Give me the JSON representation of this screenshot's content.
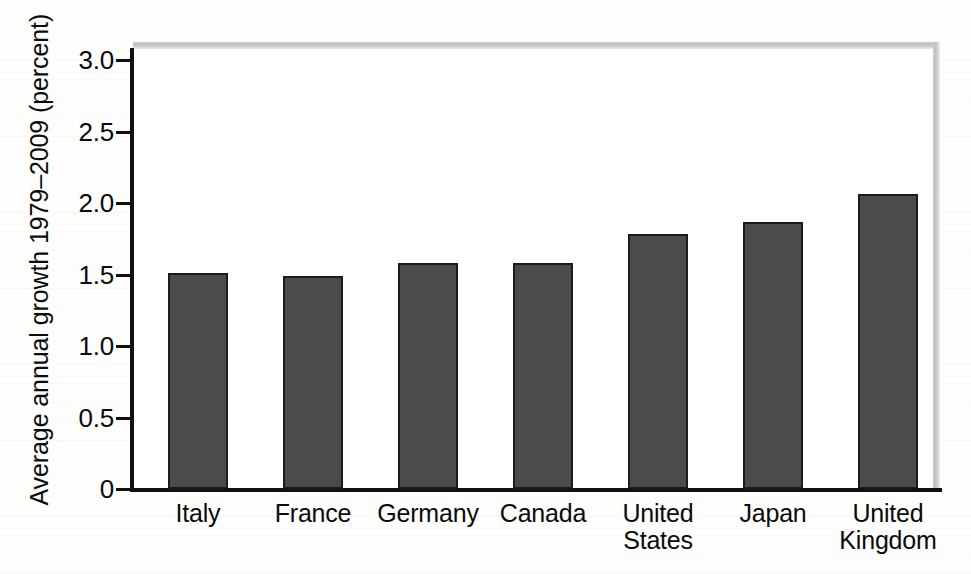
{
  "chart_data": {
    "type": "bar",
    "title": "",
    "subtitle": "",
    "xlabel": "",
    "ylabel": "Average annual growth 1979–2009 (percent)",
    "categories": [
      "Italy",
      "France",
      "Germany",
      "Canada",
      "United States",
      "Japan",
      "United Kingdom"
    ],
    "values": [
      1.51,
      1.49,
      1.58,
      1.58,
      1.78,
      1.87,
      2.06
    ],
    "ylim": [
      0,
      3.0
    ],
    "yticks": [
      0,
      0.5,
      1.0,
      1.5,
      2.0,
      2.5,
      3.0
    ],
    "ytick_labels": [
      "0",
      "0.5",
      "1.0",
      "1.5",
      "2.0",
      "2.5",
      "3.0"
    ],
    "grid": false,
    "legend": null,
    "legend_position": "none",
    "bar_color": "#4b4b4b",
    "bar_edge_color": "#1b1b1b",
    "axis_color": "#111111",
    "background_color": "#ffffff",
    "annotations": []
  },
  "figure": {
    "frame_color": "#c4c4c4",
    "page_background": "#fdfdfb"
  }
}
